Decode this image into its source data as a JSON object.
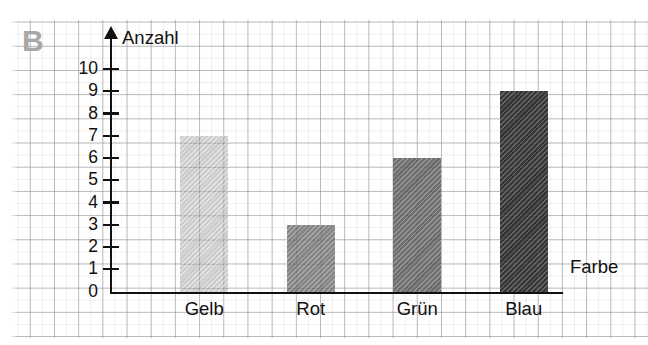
{
  "panel": {
    "label": "B"
  },
  "chart_data": {
    "type": "bar",
    "title": "",
    "subtitle": "",
    "xlabel": "Farbe",
    "ylabel": "Anzahl",
    "categories": [
      "Gelb",
      "Rot",
      "Grün",
      "Blau"
    ],
    "values": [
      7,
      3,
      6,
      9
    ],
    "ylim": [
      0,
      10
    ],
    "yticks": [
      0,
      1,
      2,
      3,
      4,
      5,
      6,
      7,
      8,
      9,
      10
    ],
    "ytick_labels": [
      "0",
      "1",
      "2",
      "3",
      "4",
      "5",
      "6",
      "7",
      "8",
      "9",
      "10"
    ],
    "grid": true,
    "legend": "none",
    "bar_colors": [
      "#dcdcdc",
      "#8f8f8f",
      "#777777",
      "#3a3a3a"
    ],
    "series": [
      {
        "name": "Anzahl",
        "points": [
          {
            "category": "Gelb",
            "value": 7,
            "color": "#dcdcdc"
          },
          {
            "category": "Rot",
            "value": 3,
            "color": "#8f8f8f"
          },
          {
            "category": "Grün",
            "value": 6,
            "color": "#777777"
          },
          {
            "category": "Blau",
            "value": 9,
            "color": "#3a3a3a"
          }
        ]
      }
    ],
    "axis_arrow_y": true,
    "background": "graph-paper"
  },
  "style": {
    "panel_label_color": "#a8a8a8",
    "axis_color": "#111111",
    "grid_color": "#c8c8cd",
    "paper_color": "#ffffff"
  }
}
